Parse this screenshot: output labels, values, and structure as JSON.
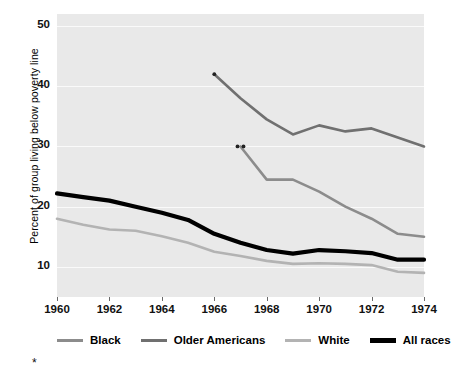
{
  "chart_data": {
    "type": "line",
    "title": "",
    "subtitle": "",
    "xlabel": "",
    "ylabel": "Percent of group living below poverty line",
    "xlim": [
      1960,
      1974
    ],
    "ylim": [
      5,
      52
    ],
    "yticks": [
      10,
      20,
      30,
      40,
      50
    ],
    "ytick_labels": [
      "10",
      "20",
      "30",
      "40",
      "50"
    ],
    "xticks": [
      1960,
      1962,
      1964,
      1966,
      1968,
      1970,
      1972,
      1974
    ],
    "xtick_labels": [
      "1960",
      "1962",
      "1964",
      "1966",
      "1968",
      "1970",
      "1972",
      "1974"
    ],
    "grid": true,
    "grid_axis": "y",
    "legend_position": "below",
    "plot_background": "#e9e9e9",
    "series": [
      {
        "name": "Black",
        "color": "#8c8c8c",
        "width": 2.6,
        "marker_note": "**",
        "x": [
          1967,
          1968,
          1969,
          1970,
          1971,
          1972,
          1973,
          1974
        ],
        "values": [
          30.0,
          24.5,
          24.5,
          22.5,
          20.0,
          18.0,
          15.5,
          15.0
        ]
      },
      {
        "name": "Older Americans",
        "color": "#707070",
        "width": 2.6,
        "marker_note": "*",
        "x": [
          1966,
          1967,
          1968,
          1969,
          1970,
          1971,
          1972,
          1973,
          1974
        ],
        "values": [
          42.0,
          38.0,
          34.5,
          32.0,
          33.5,
          32.5,
          33.0,
          31.5,
          30.0
        ]
      },
      {
        "name": "White",
        "color": "#b3b3b3",
        "width": 2.6,
        "x": [
          1960,
          1961,
          1962,
          1963,
          1964,
          1965,
          1966,
          1967,
          1968,
          1969,
          1970,
          1971,
          1972,
          1973,
          1974
        ],
        "values": [
          18.0,
          17.0,
          16.2,
          16.0,
          15.1,
          14.0,
          12.5,
          11.8,
          11.0,
          10.5,
          10.6,
          10.5,
          10.3,
          9.2,
          9.0
        ]
      },
      {
        "name": "All races",
        "color": "#000000",
        "width": 4.2,
        "x": [
          1960,
          1961,
          1962,
          1963,
          1964,
          1965,
          1966,
          1967,
          1968,
          1969,
          1970,
          1971,
          1972,
          1973,
          1974
        ],
        "values": [
          22.2,
          21.6,
          21.0,
          20.0,
          19.0,
          17.8,
          15.5,
          14.0,
          12.8,
          12.2,
          12.8,
          12.6,
          12.3,
          11.2,
          11.2
        ]
      }
    ],
    "annotations": [
      {
        "text": "*",
        "x": 1966,
        "y": 42.0,
        "series": "Older Americans"
      },
      {
        "text": "**",
        "x": 1967,
        "y": 30.0,
        "series": "Black"
      }
    ]
  },
  "legend": {
    "items": [
      {
        "label": "Black",
        "color": "#8c8c8c",
        "thickness": "3px"
      },
      {
        "label": "Older Americans",
        "color": "#707070",
        "thickness": "3px"
      },
      {
        "label": "White",
        "color": "#b3b3b3",
        "thickness": "3px"
      },
      {
        "label": "All races",
        "color": "#000000",
        "thickness": "5px"
      }
    ]
  },
  "footnote": {
    "mark": "*"
  }
}
